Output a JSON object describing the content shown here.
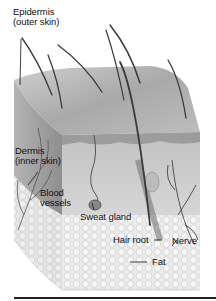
{
  "diagram": {
    "type": "anatomical cross-section",
    "subject": "skin",
    "labels": [
      {
        "id": "epidermis",
        "lines": [
          "Epidermis",
          "(outer skin)"
        ]
      },
      {
        "id": "dermis",
        "lines": [
          "Dermis",
          "(inner skin)"
        ]
      },
      {
        "id": "blood_vessels",
        "lines": [
          "Blood",
          "vessels"
        ]
      },
      {
        "id": "sweat_gland",
        "lines": [
          "Sweat gland"
        ]
      },
      {
        "id": "hair_root",
        "lines": [
          "Hair root"
        ]
      },
      {
        "id": "nerve",
        "lines": [
          "Nerve"
        ]
      },
      {
        "id": "fat",
        "lines": [
          "Fat"
        ]
      }
    ]
  },
  "colors": {
    "epidermis_top": "#b8b8b8",
    "epidermis_side": "#9a9a9a",
    "dermis_front": "#c9c9c9",
    "dermis_side": "#a8a8a8",
    "fat": "#e6e6e6",
    "hair": "#3a3a3a",
    "rule": "#222222"
  }
}
